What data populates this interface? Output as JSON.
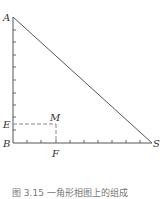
{
  "figure": {
    "points": {
      "A": {
        "label": "A",
        "x": 13,
        "y": 17
      },
      "B": {
        "label": "B",
        "x": 13,
        "y": 143
      },
      "S": {
        "label": "S",
        "x": 152,
        "y": 143
      },
      "E": {
        "label": "E",
        "x": 13,
        "y": 124
      },
      "M": {
        "label": "M",
        "x": 56,
        "y": 124
      },
      "F": {
        "label": "F",
        "x": 56,
        "y": 143
      }
    },
    "vertical_ticks": [
      130,
      117,
      105,
      93,
      80,
      67,
      55,
      42,
      30
    ],
    "horizontal_ticks": [
      27,
      41,
      56,
      70,
      84,
      98,
      112,
      126,
      140
    ],
    "caption": "图 3.15   一角形相图上的组成"
  },
  "colors": {
    "line": "#555555",
    "dash": "#888888",
    "text": "#333333"
  }
}
